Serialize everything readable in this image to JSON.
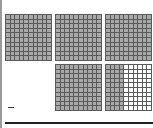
{
  "figure": {
    "title_partial": "",
    "grid_size": 10,
    "colors": {
      "shaded": "#a9a9a9",
      "unshaded": "#ffffff",
      "lines": "#5a5a5a"
    },
    "grids": [
      {
        "row": 1,
        "col": 1,
        "shaded_columns": 10
      },
      {
        "row": 1,
        "col": 2,
        "shaded_columns": 10
      },
      {
        "row": 1,
        "col": 3,
        "shaded_columns": 10
      },
      {
        "row": 2,
        "col": 2,
        "shaded_columns": 10
      },
      {
        "row": 2,
        "col": 3,
        "shaded_columns": 4
      }
    ],
    "answer_blank": "—"
  }
}
